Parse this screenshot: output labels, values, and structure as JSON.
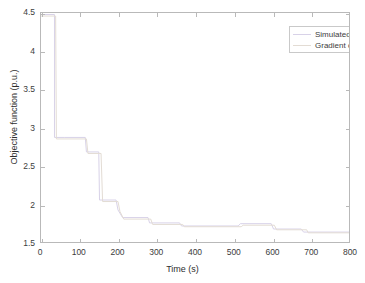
{
  "chart_data": {
    "type": "line",
    "title": "",
    "xlabel": "Time (s)",
    "ylabel": "Objective function (p.u.)",
    "xlim": [
      0,
      800
    ],
    "ylim": [
      1.5,
      4.5
    ],
    "xticks": [
      0,
      100,
      200,
      300,
      400,
      500,
      600,
      700,
      800
    ],
    "xticklabels": [
      "0",
      "100",
      "200",
      "300",
      "400",
      "500",
      "600",
      "700",
      "800"
    ],
    "yticks": [
      1.5,
      2,
      2.5,
      3,
      3.5,
      4,
      4.5
    ],
    "yticklabels": [
      "1.5",
      "2",
      "2.5",
      "3",
      "3.5",
      "4",
      "4.5"
    ],
    "grid": false,
    "legend_position": "upper right",
    "drawstyle": "steps-post",
    "series": [
      {
        "name": "Simulated annealing",
        "color": "#d8d2e8",
        "x": [
          0,
          35,
          35,
          62,
          115,
          118,
          150,
          152,
          195,
          200,
          212,
          278,
          282,
          360,
          365,
          512,
          518,
          598,
          604,
          676,
          682,
          800
        ],
        "y": [
          4.48,
          4.48,
          2.87,
          2.87,
          2.87,
          2.68,
          2.68,
          2.05,
          2.05,
          1.92,
          1.82,
          1.82,
          1.75,
          1.75,
          1.71,
          1.71,
          1.74,
          1.74,
          1.67,
          1.67,
          1.63,
          1.63
        ]
      },
      {
        "name": "Gradient descent",
        "color": "#e3dcd4",
        "x": [
          0,
          38,
          40,
          118,
          122,
          156,
          160,
          200,
          205,
          215,
          285,
          290,
          368,
          372,
          520,
          525,
          606,
          612,
          690,
          694,
          800
        ],
        "y": [
          4.46,
          4.46,
          2.85,
          2.85,
          2.66,
          2.66,
          2.03,
          2.03,
          1.9,
          1.8,
          1.8,
          1.73,
          1.73,
          1.7,
          1.7,
          1.72,
          1.72,
          1.66,
          1.66,
          1.62,
          1.62
        ]
      }
    ]
  },
  "legend": {
    "entries": [
      {
        "label": "Simulated annealing",
        "color": "#d8d2e8"
      },
      {
        "label": "Gradient descent",
        "color": "#e3dcd4"
      }
    ]
  },
  "axes": {
    "x_label": "Time (s)",
    "y_label": "Objective function (p.u.)"
  },
  "colors": {
    "axis": "#b9b9b9",
    "text": "#3c3c3c",
    "background": "#ffffff"
  }
}
